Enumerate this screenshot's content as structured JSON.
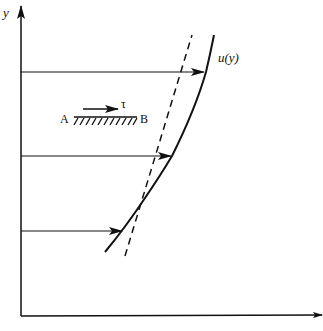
{
  "diagram": {
    "type": "velocity-profile",
    "axes": {
      "y_label": "y",
      "x_label": ""
    },
    "curve_label": "u(y)",
    "wall": {
      "left_label": "A",
      "right_label": "B",
      "stress_label": "τ"
    },
    "velocity_arrows": [
      {
        "y": 72,
        "x_end": 205
      },
      {
        "y": 156,
        "x_end": 172
      },
      {
        "y": 231,
        "x_end": 123
      }
    ],
    "colors": {
      "ink": "#111111",
      "background": "#ffffff"
    }
  }
}
